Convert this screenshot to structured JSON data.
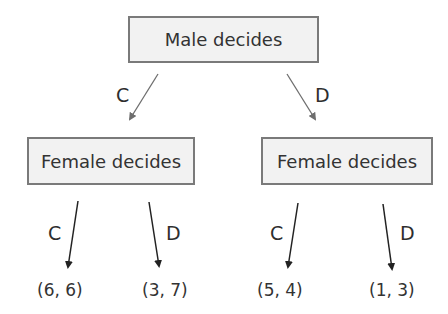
{
  "diagram": {
    "type": "game-tree",
    "root": {
      "label": "Male decides"
    },
    "branches": [
      {
        "move": "C",
        "node": {
          "label": "Female decides",
          "branches": [
            {
              "move": "C",
              "payoff": "(6, 6)"
            },
            {
              "move": "D",
              "payoff": "(3, 7)"
            }
          ]
        }
      },
      {
        "move": "D",
        "node": {
          "label": "Female decides",
          "branches": [
            {
              "move": "C",
              "payoff": "(5, 4)"
            },
            {
              "move": "D",
              "payoff": "(1, 3)"
            }
          ]
        }
      }
    ],
    "colors": {
      "node_fill": "#f2f2f2",
      "node_border": "#7a7a7a",
      "text": "#333333",
      "arrow_top": "#6e6e6e",
      "arrow_bottom": "#222222"
    }
  }
}
